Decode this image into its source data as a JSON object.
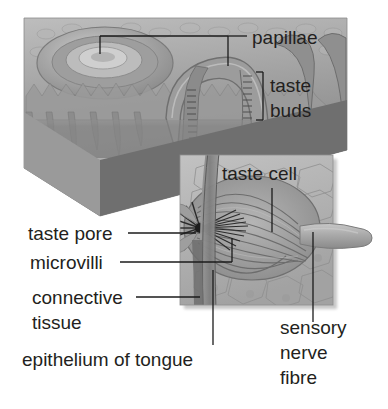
{
  "figure": {
    "background_color": "#ffffff",
    "ink_color": "#231f20",
    "leader_color": "#1b1b1b"
  },
  "labels": {
    "papillae": "papillae",
    "taste_buds_line1": "taste",
    "taste_buds_line2": "buds",
    "taste_cell": "taste cell",
    "taste_pore": "taste pore",
    "microvilli": "microvilli",
    "connective_line1": "connective",
    "connective_line2": "tissue",
    "epithelium": "epithelium of tongue",
    "sensory_line1": "sensory",
    "sensory_line2": "nerve",
    "sensory_line3": "fibre"
  },
  "artwork": {
    "tongue_block": {
      "name": "tongue-tissue-block",
      "top_surface_color": "#9a9a9a",
      "front_face_color": "#8e8e8e",
      "side_face_color": "#6e6e6e"
    },
    "taste_bud_inset": {
      "name": "taste-bud-magnified-panel",
      "panel_color": "#adadad",
      "bud_color": "#8f8f8f",
      "nerve_color": "#a8a8a8"
    }
  }
}
